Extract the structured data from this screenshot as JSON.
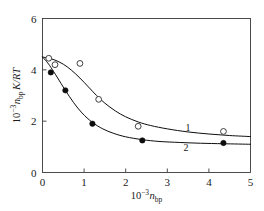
{
  "chart_data": {
    "type": "scatter",
    "title": "",
    "subtitle": "",
    "xlabel": "10^-3 n_bp",
    "ylabel": "10^-3 n_bp K/RT",
    "xlim": [
      0,
      5
    ],
    "ylim": [
      0,
      6
    ],
    "xticks": [
      "0",
      "1",
      "2",
      "3",
      "4",
      "5"
    ],
    "xtick_values": [
      0,
      1,
      2,
      3,
      4,
      5
    ],
    "yticks": [
      "0",
      "2",
      "4",
      "6"
    ],
    "ytick_values": [
      0,
      2,
      4,
      6
    ],
    "grid": false,
    "legend_position": "inline-curve-labels",
    "series": [
      {
        "name": "1",
        "marker": "open-circle",
        "label": "1",
        "label_x": 3.5,
        "label_y": 1.62,
        "points": [
          {
            "x": 0.15,
            "y": 4.45
          },
          {
            "x": 0.3,
            "y": 4.2
          },
          {
            "x": 0.9,
            "y": 4.25
          },
          {
            "x": 1.35,
            "y": 2.85
          },
          {
            "x": 2.3,
            "y": 1.8
          },
          {
            "x": 4.35,
            "y": 1.6
          }
        ],
        "curve": [
          {
            "x": 0.0,
            "y": 4.5
          },
          {
            "x": 0.15,
            "y": 4.45
          },
          {
            "x": 0.3,
            "y": 4.38
          },
          {
            "x": 0.5,
            "y": 4.22
          },
          {
            "x": 0.7,
            "y": 3.98
          },
          {
            "x": 0.9,
            "y": 3.68
          },
          {
            "x": 1.1,
            "y": 3.34
          },
          {
            "x": 1.3,
            "y": 3.0
          },
          {
            "x": 1.5,
            "y": 2.7
          },
          {
            "x": 1.75,
            "y": 2.4
          },
          {
            "x": 2.0,
            "y": 2.17
          },
          {
            "x": 2.3,
            "y": 1.97
          },
          {
            "x": 2.6,
            "y": 1.83
          },
          {
            "x": 3.0,
            "y": 1.7
          },
          {
            "x": 3.5,
            "y": 1.58
          },
          {
            "x": 4.0,
            "y": 1.5
          },
          {
            "x": 4.5,
            "y": 1.44
          },
          {
            "x": 5.0,
            "y": 1.4
          }
        ]
      },
      {
        "name": "2",
        "marker": "filled-circle",
        "label": "2",
        "label_x": 3.45,
        "label_y": 0.82,
        "points": [
          {
            "x": 0.2,
            "y": 3.9
          },
          {
            "x": 0.55,
            "y": 3.2
          },
          {
            "x": 1.2,
            "y": 1.9
          },
          {
            "x": 2.4,
            "y": 1.25
          },
          {
            "x": 4.35,
            "y": 1.15
          }
        ],
        "curve": [
          {
            "x": 0.0,
            "y": 4.5
          },
          {
            "x": 0.1,
            "y": 4.32
          },
          {
            "x": 0.2,
            "y": 4.1
          },
          {
            "x": 0.35,
            "y": 3.72
          },
          {
            "x": 0.55,
            "y": 3.2
          },
          {
            "x": 0.75,
            "y": 2.72
          },
          {
            "x": 0.95,
            "y": 2.32
          },
          {
            "x": 1.2,
            "y": 1.95
          },
          {
            "x": 1.45,
            "y": 1.7
          },
          {
            "x": 1.7,
            "y": 1.53
          },
          {
            "x": 2.0,
            "y": 1.39
          },
          {
            "x": 2.4,
            "y": 1.28
          },
          {
            "x": 2.8,
            "y": 1.21
          },
          {
            "x": 3.3,
            "y": 1.17
          },
          {
            "x": 3.8,
            "y": 1.14
          },
          {
            "x": 4.35,
            "y": 1.12
          },
          {
            "x": 5.0,
            "y": 1.1
          }
        ]
      }
    ],
    "colors": {
      "axis": "#3a3a3a",
      "curve": "#0d0d0d",
      "marker_open_stroke": "#2b2b2b",
      "marker_filled": "#0d0d0d",
      "text": "#1a1a1a",
      "background": "#ffffff"
    }
  },
  "axis_titles": {
    "x": {
      "mantissa": "10",
      "exponent": "−3",
      "variable": "n",
      "subscript": "bp"
    },
    "y": {
      "mantissa": "10",
      "exponent": "−3",
      "variable": "n",
      "subscript": "bp",
      "tail": "K/RT"
    }
  }
}
